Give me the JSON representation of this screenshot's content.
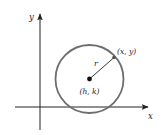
{
  "diagram": {
    "axes": {
      "x_label": "x",
      "y_label": "y",
      "color": "#222222"
    },
    "circle": {
      "center_label": "(h, k)",
      "radius_label": "r",
      "point_label": "(x, y)",
      "stroke_color": "#6e6e6e"
    }
  }
}
